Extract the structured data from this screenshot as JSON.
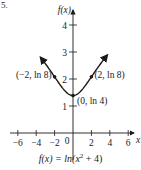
{
  "problem_number": "5.",
  "chart_data": {
    "type": "line",
    "title": "",
    "function_label": "f(x) = ln(x² + 4)",
    "xlabel": "x",
    "ylabel": "f(x)",
    "xlim": [
      -7,
      7
    ],
    "ylim": [
      0,
      4.5
    ],
    "x_ticks": [
      -6,
      -4,
      -2,
      0,
      2,
      4,
      6
    ],
    "x_tick_labels": [
      "−6",
      "−4",
      "−2",
      "0",
      "2",
      "4",
      "6"
    ],
    "y_ticks": [
      1,
      2,
      3,
      4
    ],
    "y_tick_labels": [
      "1",
      "2",
      "3",
      "4"
    ],
    "grid": false,
    "series": [
      {
        "name": "f(x) = ln(x^2 + 4)",
        "x": [
          -6,
          -5,
          -4,
          -3,
          -2,
          -1,
          0,
          1,
          2,
          3,
          4,
          5,
          6
        ],
        "y": [
          3.689,
          3.367,
          2.996,
          2.565,
          2.079,
          1.609,
          1.386,
          1.609,
          2.079,
          2.565,
          2.996,
          3.367,
          3.689
        ]
      }
    ],
    "annotations": [
      {
        "label": "(−2, ln 8)",
        "x": -2,
        "y": 2.079
      },
      {
        "label": "(2, ln 8)",
        "x": 2,
        "y": 2.079
      },
      {
        "label": "(0, ln 4)",
        "x": 0,
        "y": 1.386
      }
    ]
  },
  "caption": {
    "prefix": "f(x) = ln(x",
    "exp": "2",
    "suffix": " + 4)"
  }
}
